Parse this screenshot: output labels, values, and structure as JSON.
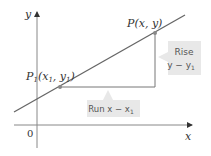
{
  "diagram": {
    "axes": {
      "x_label": "x",
      "y_label": "y",
      "origin_label": "0"
    },
    "points": {
      "p": {
        "label_main": "P",
        "label_args": "(x, y)"
      },
      "p1": {
        "label_main": "P",
        "label_sub": "1",
        "label_args_open": "(x",
        "label_args_sub1": "1",
        "label_args_mid": ", y",
        "label_args_sub2": "1",
        "label_args_close": ")"
      }
    },
    "callouts": {
      "rise": {
        "line1": "Rise",
        "line2": "y − y",
        "line2_sub": "1"
      },
      "run": {
        "text": "Run x − x",
        "text_sub": "1"
      }
    },
    "colors": {
      "line": "#666666",
      "axis": "#888888",
      "callout_bg": "#e8e8e8",
      "point": "#888888"
    }
  }
}
